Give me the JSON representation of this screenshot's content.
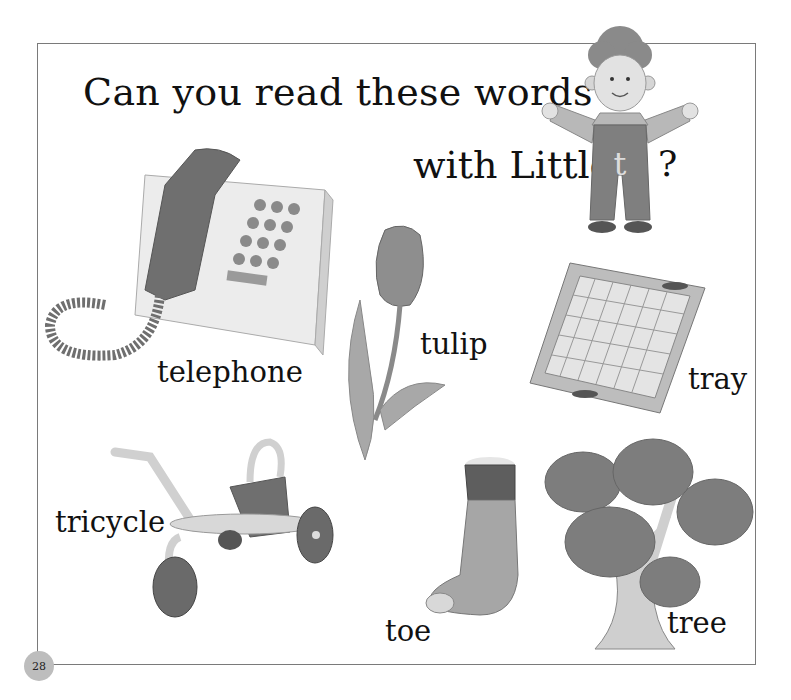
{
  "page": {
    "title_line1": "Can you read these words",
    "title_line2": "with Little",
    "title_letter": "t",
    "title_end": "?",
    "page_number": "28"
  },
  "words": [
    {
      "id": "telephone",
      "label": "telephone"
    },
    {
      "id": "tulip",
      "label": "tulip"
    },
    {
      "id": "tray",
      "label": "tray"
    },
    {
      "id": "tricycle",
      "label": "tricycle"
    },
    {
      "id": "toe",
      "label": "toe"
    },
    {
      "id": "tree",
      "label": "tree"
    }
  ],
  "illustrations": [
    {
      "id": "little-t-boy",
      "depicts": "boy in overalls with letter t"
    },
    {
      "id": "telephone",
      "depicts": "desk telephone with coiled cord"
    },
    {
      "id": "tulip",
      "depicts": "tulip flower with leaves"
    },
    {
      "id": "tray",
      "depicts": "wooden tray with checkered base"
    },
    {
      "id": "tricycle",
      "depicts": "child's tricycle"
    },
    {
      "id": "toe",
      "depicts": "foot in sock with big toe poking out"
    },
    {
      "id": "tree",
      "depicts": "leafy tree"
    }
  ],
  "colors": {
    "frame": "#7a7a7a",
    "page_number_circle": "#bdbdbd",
    "ink": "#111111"
  }
}
